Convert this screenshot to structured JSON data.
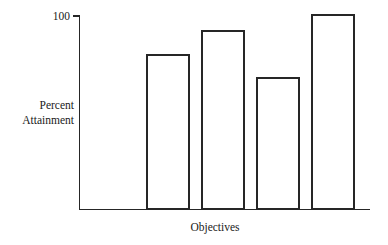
{
  "chart_data": {
    "type": "bar",
    "title": "",
    "subtitle": "",
    "xlabel": "Objectives",
    "ylabel": "Percent Attainment",
    "ylabel_lines": [
      "Percent",
      "Attainment"
    ],
    "categories": [
      "1",
      "2",
      "3",
      "4",
      "5"
    ],
    "values": [
      92,
      80,
      92,
      68,
      100
    ],
    "ylim": [
      0,
      100
    ],
    "ytick_labels": [
      "100"
    ],
    "ytick_values": [
      100
    ],
    "xtick_labels": [],
    "grid": false,
    "legend": false,
    "legend_position": "none",
    "annotations": [],
    "style": {
      "bar_fill": "#ffffff",
      "bar_stroke": "#262626",
      "axis_color": "#262626",
      "text_color": "#1a1a1a",
      "background": "#ffffff"
    }
  },
  "figure": {
    "axis_origin_x": 79,
    "axis_origin_y": 209,
    "axis_top_y": 16,
    "axis_right_x": 370,
    "bar_width": 42,
    "bar_gap": 13,
    "first_bar_left": 92
  }
}
